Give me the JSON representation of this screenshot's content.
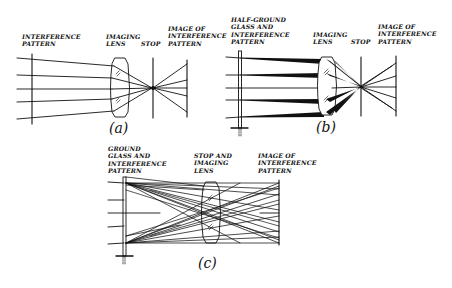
{
  "figure": {
    "diagrams": [
      {
        "id": "a",
        "caption": "(a)",
        "labels": {
          "source": "INTERFERENCE\nPATTERN",
          "lens": "IMAGING\nLENS",
          "stop": "STOP",
          "image": "IMAGE OF\nINTERFERENCE\nPATTERN"
        }
      },
      {
        "id": "b",
        "caption": "(b)",
        "labels": {
          "source": "HALF-GROUND\nGLASS AND\nINTERFERENCE\nPATTERN",
          "lens": "IMAGING\nLENS",
          "stop": "STOP",
          "image": "IMAGE OF\nINTERFERENCE\nPATTERN"
        }
      },
      {
        "id": "c",
        "caption": "(c)",
        "labels": {
          "source": "GROUND\nGLASS AND\nINTERFERENCE\nPATTERN",
          "lens": "STOP AND\nIMAGING\nLENS",
          "image": "IMAGE OF\nINTERFERENCE\nPATTERN"
        }
      }
    ],
    "colors": {
      "ink": "#111111",
      "background": "#ffffff"
    }
  }
}
